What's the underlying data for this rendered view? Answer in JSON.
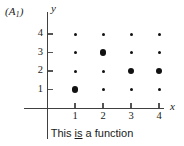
{
  "figure": {
    "panel_label": "(A",
    "panel_label_sub": "1",
    "panel_label_close": ")",
    "caption_before": "This ",
    "caption_emphasis": "is",
    "caption_after": " a function",
    "axis_x_name": "x",
    "axis_y_name": "y"
  },
  "chart_data": {
    "type": "scatter",
    "title": "This is a function",
    "xlabel": "x",
    "ylabel": "y",
    "xlim": [
      0,
      5
    ],
    "ylim": [
      0,
      5
    ],
    "grid": false,
    "legend": "none",
    "x_ticks": [
      "1",
      "2",
      "3",
      "4"
    ],
    "y_ticks": [
      "1",
      "2",
      "3",
      "4"
    ],
    "x_tick_values": [
      1,
      2,
      3,
      4
    ],
    "y_tick_values": [
      1,
      2,
      3,
      4
    ],
    "annotation": "(A1)",
    "points": [
      {
        "x": 1,
        "y": 1,
        "size": "large",
        "selected": true
      },
      {
        "x": 1,
        "y": 2,
        "size": "small",
        "selected": false
      },
      {
        "x": 1,
        "y": 3,
        "size": "small",
        "selected": false
      },
      {
        "x": 1,
        "y": 4,
        "size": "small",
        "selected": false
      },
      {
        "x": 2,
        "y": 1,
        "size": "small",
        "selected": false
      },
      {
        "x": 2,
        "y": 2,
        "size": "small",
        "selected": false
      },
      {
        "x": 2,
        "y": 3,
        "size": "large",
        "selected": true
      },
      {
        "x": 2,
        "y": 4,
        "size": "small",
        "selected": false
      },
      {
        "x": 3,
        "y": 1,
        "size": "small",
        "selected": false
      },
      {
        "x": 3,
        "y": 2,
        "size": "large",
        "selected": true
      },
      {
        "x": 3,
        "y": 3,
        "size": "small",
        "selected": false
      },
      {
        "x": 3,
        "y": 4,
        "size": "small",
        "selected": false
      },
      {
        "x": 4,
        "y": 1,
        "size": "small",
        "selected": false
      },
      {
        "x": 4,
        "y": 2,
        "size": "large",
        "selected": true
      },
      {
        "x": 4,
        "y": 3,
        "size": "small",
        "selected": false
      },
      {
        "x": 4,
        "y": 4,
        "size": "small",
        "selected": false
      }
    ],
    "mapping": [
      {
        "input": 1,
        "output": 1
      },
      {
        "input": 2,
        "output": 3
      },
      {
        "input": 3,
        "output": 2
      },
      {
        "input": 4,
        "output": 2
      }
    ],
    "colors": {
      "dot": "#111111",
      "axis": "#404040",
      "text": "#1a1a1a",
      "background": "#ffffff"
    }
  }
}
